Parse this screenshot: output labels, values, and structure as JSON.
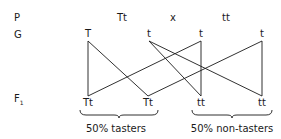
{
  "rows": {
    "parents": "P",
    "gametes": "G",
    "f1": "F",
    "f1_subscript": "1"
  },
  "parents": {
    "left": "Tt",
    "cross": "x",
    "right": "tt"
  },
  "gametes": [
    {
      "label": "T",
      "x": 88
    },
    {
      "label": "t",
      "x": 149
    },
    {
      "label": "t",
      "x": 201
    },
    {
      "label": "t",
      "x": 262
    }
  ],
  "offspring": [
    {
      "label": "Tt",
      "x": 88
    },
    {
      "label": "Tt",
      "x": 148
    },
    {
      "label": "tt",
      "x": 201
    },
    {
      "label": "tt",
      "x": 262
    }
  ],
  "crosses": [
    {
      "from": 0,
      "to": 0
    },
    {
      "from": 0,
      "to": 1
    },
    {
      "from": 1,
      "to": 2
    },
    {
      "from": 1,
      "to": 3
    },
    {
      "from": 2,
      "to": 0
    },
    {
      "from": 2,
      "to": 2
    },
    {
      "from": 3,
      "to": 1
    },
    {
      "from": 3,
      "to": 3
    }
  ],
  "groups": [
    {
      "caption": "50% tasters",
      "x1": 80,
      "x2": 158
    },
    {
      "caption": "50% non-tasters",
      "x1": 192,
      "x2": 272
    }
  ],
  "colors": {
    "ink": "#1a1a1a"
  }
}
